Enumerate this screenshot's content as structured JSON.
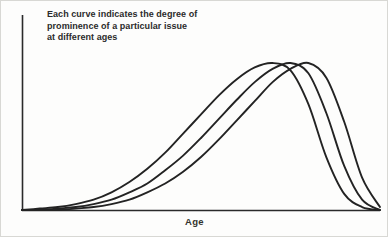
{
  "caption": {
    "lines": [
      "Each curve indicates the degree of",
      "prominence of a particular issue",
      "at different ages"
    ]
  },
  "axes": {
    "xlabel": "Age",
    "ylabel": ""
  },
  "style": {
    "background": "#fdfdfc",
    "line_color": "#232323",
    "axis_color": "#2a2a2a",
    "text_color": "#2b2b2b",
    "frame_color": "#d8d8d4"
  },
  "chart_data": {
    "type": "line",
    "title": "",
    "subtitle": "",
    "annotations": [
      "Each curve indicates the degree of prominence of a particular issue at different ages"
    ],
    "xlabel": "Age",
    "ylabel": "",
    "xlim": [
      0,
      100
    ],
    "ylim": [
      0,
      1
    ],
    "grid": false,
    "legend": false,
    "legend_position": "none",
    "xticks": [],
    "yticks": [],
    "x": [
      0,
      5,
      10,
      15,
      20,
      25,
      30,
      35,
      40,
      45,
      50,
      55,
      60,
      65,
      70,
      75,
      80,
      85,
      90,
      95,
      100
    ],
    "series": [
      {
        "name": "issue-1",
        "peak_x": 63,
        "values": [
          0.0,
          0.01,
          0.02,
          0.04,
          0.07,
          0.12,
          0.19,
          0.28,
          0.39,
          0.52,
          0.65,
          0.78,
          0.89,
          0.97,
          1.0,
          0.95,
          0.72,
          0.36,
          0.11,
          0.02,
          0.0
        ]
      },
      {
        "name": "issue-2",
        "peak_x": 72,
        "values": [
          0.0,
          0.0,
          0.01,
          0.02,
          0.04,
          0.07,
          0.12,
          0.18,
          0.27,
          0.37,
          0.49,
          0.62,
          0.75,
          0.87,
          0.96,
          1.0,
          0.93,
          0.66,
          0.3,
          0.07,
          0.0
        ]
      },
      {
        "name": "issue-3",
        "peak_x": 80,
        "values": [
          0.0,
          0.0,
          0.0,
          0.01,
          0.02,
          0.04,
          0.07,
          0.12,
          0.18,
          0.26,
          0.36,
          0.48,
          0.61,
          0.74,
          0.87,
          0.96,
          1.0,
          0.9,
          0.6,
          0.22,
          0.02
        ]
      }
    ]
  }
}
